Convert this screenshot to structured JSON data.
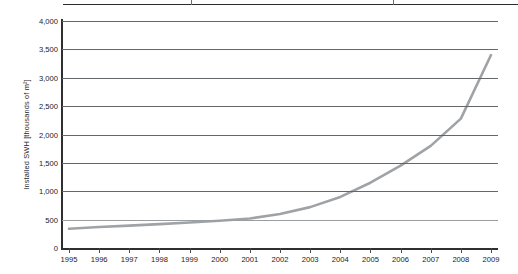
{
  "figure": {
    "background_color": "#ffffff",
    "axis_color": "#2f2f2f",
    "gridline_color": "#63676a",
    "series_color": "#a0a3a6"
  },
  "table_edge": {
    "label": "table-bottom-border-fragment"
  },
  "chart_data": {
    "type": "line",
    "title": "",
    "xlabel": "",
    "ylabel": "Installed SWH [thousands of m²]",
    "categories": [
      "1995",
      "1996",
      "1997",
      "1998",
      "1999",
      "2000",
      "2001",
      "2002",
      "2003",
      "2004",
      "2005",
      "2006",
      "2007",
      "2008",
      "2009"
    ],
    "x": [
      1995,
      1996,
      1997,
      1998,
      1999,
      2000,
      2001,
      2002,
      2003,
      2004,
      2005,
      2006,
      2007,
      2008,
      2009
    ],
    "values": [
      340,
      370,
      395,
      420,
      450,
      480,
      520,
      600,
      720,
      900,
      1150,
      1450,
      1800,
      2280,
      3400
    ],
    "ylim": [
      0,
      4000
    ],
    "ytick_values": [
      0,
      500,
      1000,
      1500,
      2000,
      2500,
      3000,
      3500,
      4000
    ],
    "ytick_labels": [
      "0",
      "500",
      "1,000",
      "1,500",
      "2,000",
      "2,500",
      "3,000",
      "3,500",
      "4,000"
    ],
    "grid": true,
    "legend": false,
    "legend_position": "none",
    "series": [
      {
        "name": "Installed SWH",
        "color": "#a0a3a6",
        "values": [
          340,
          370,
          395,
          420,
          450,
          480,
          520,
          600,
          720,
          900,
          1150,
          1450,
          1800,
          2280,
          3400
        ]
      }
    ]
  }
}
